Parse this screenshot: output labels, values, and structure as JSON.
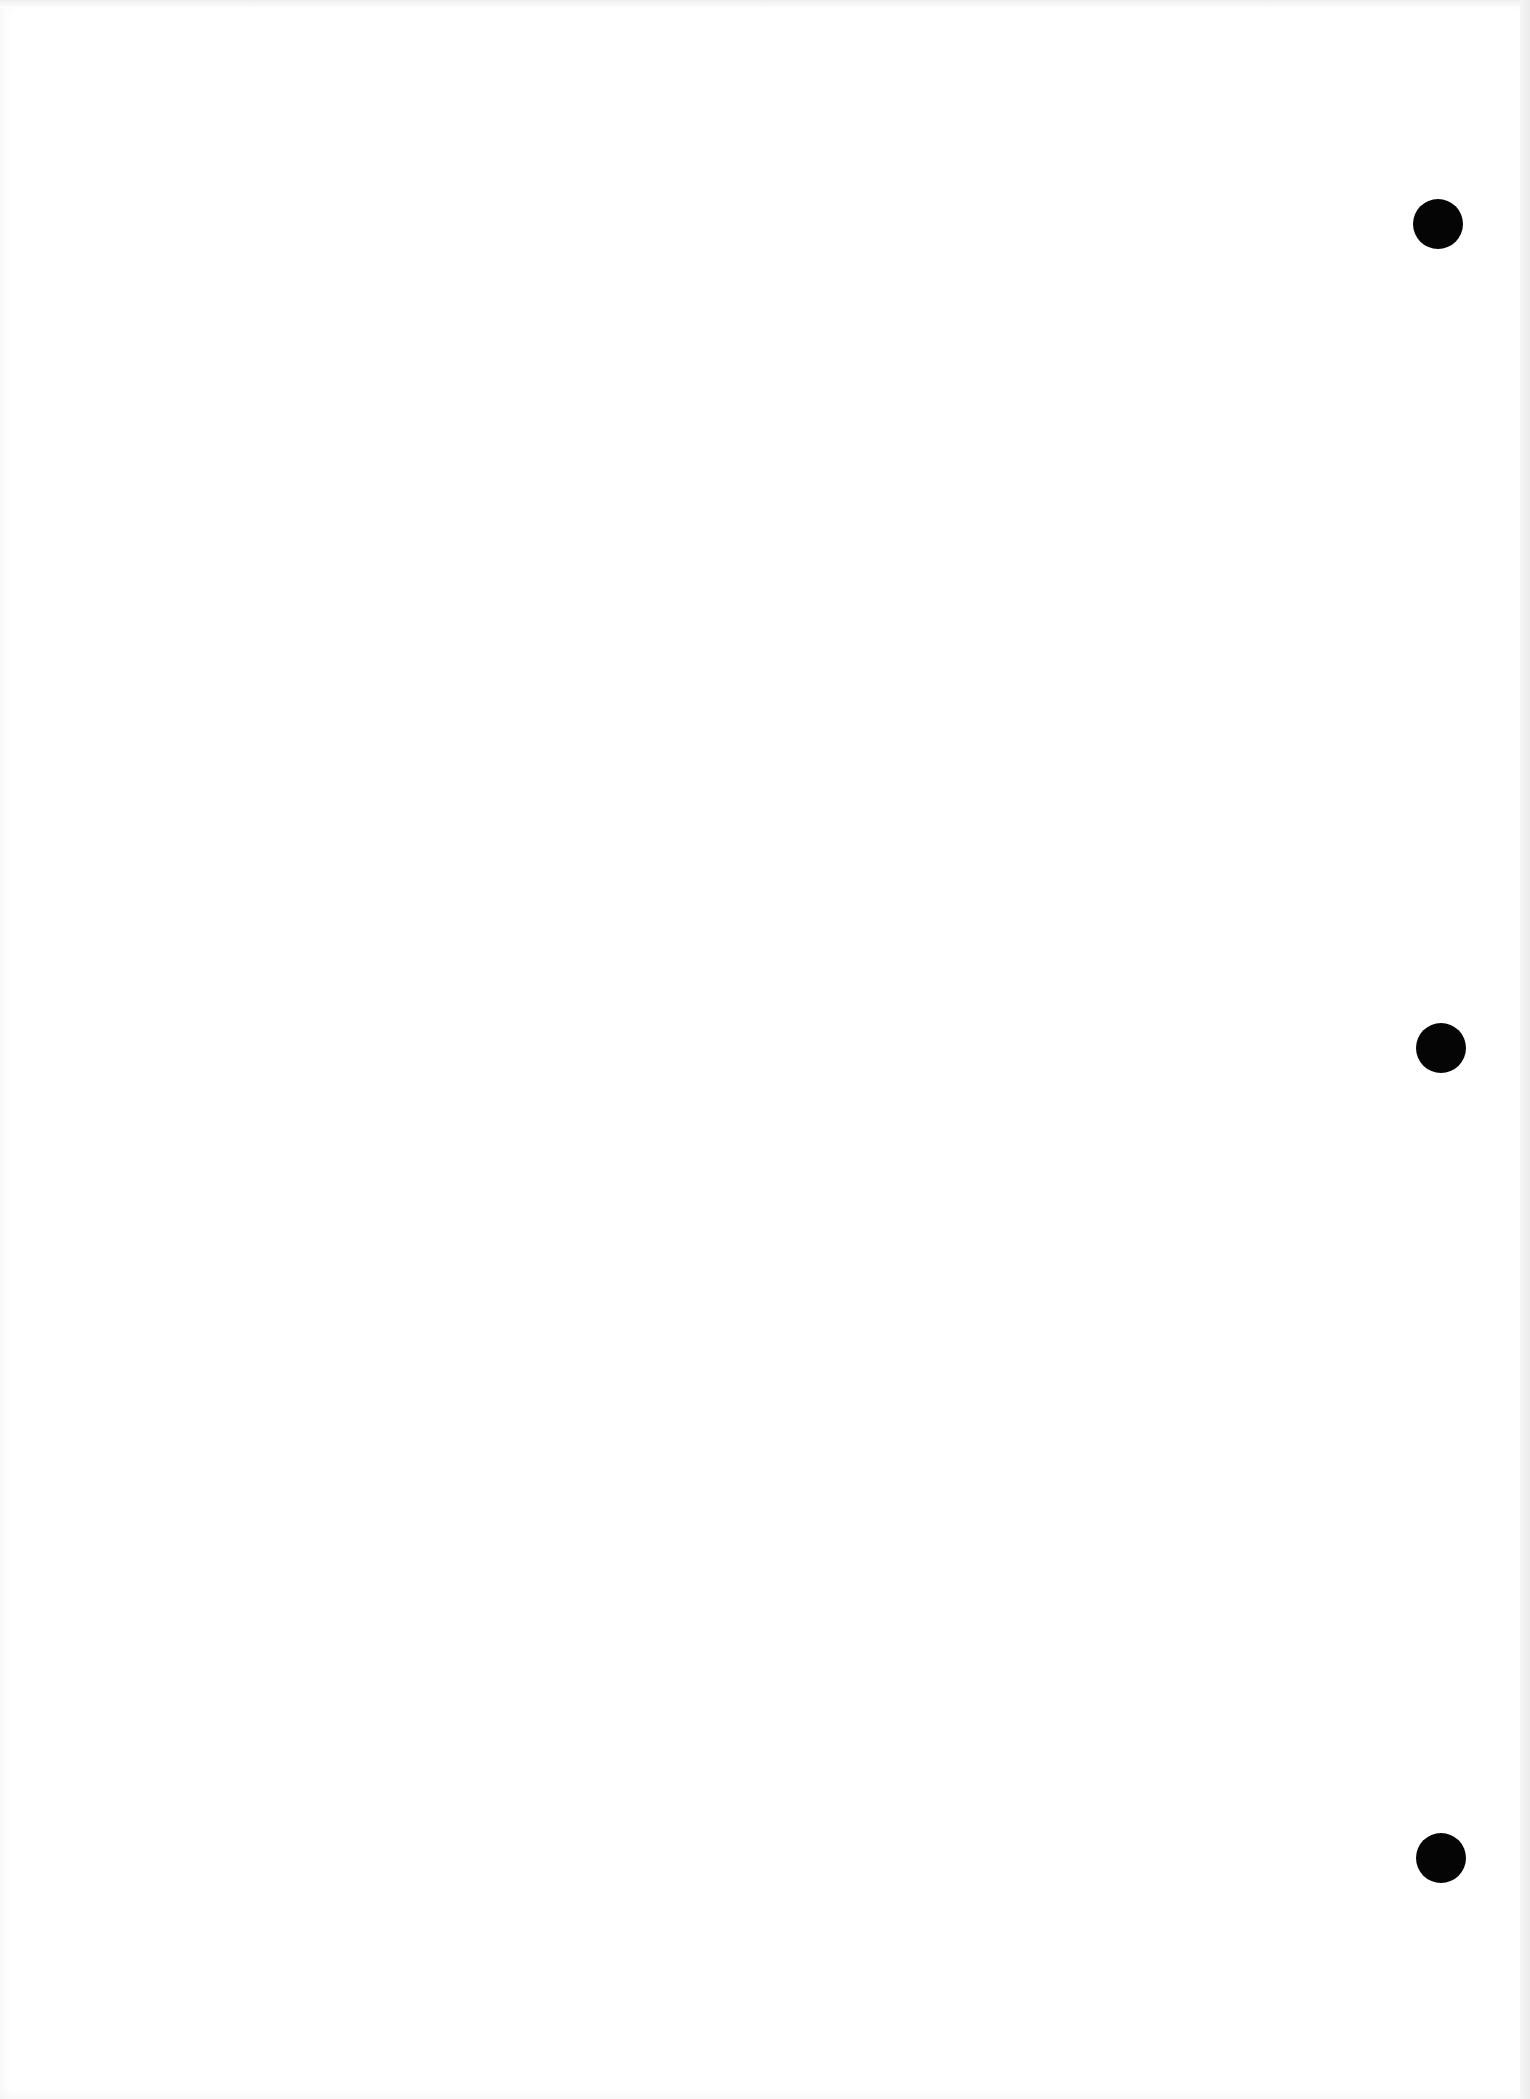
{
  "page": {
    "type": "blank scanned sheet",
    "background": "#ffffff",
    "hole_color": "#050505",
    "punch_holes": [
      {
        "cx": 1438,
        "cy": 224,
        "diameter": 50
      },
      {
        "cx": 1441,
        "cy": 1048,
        "diameter": 50
      },
      {
        "cx": 1441,
        "cy": 1858,
        "diameter": 50
      }
    ]
  }
}
